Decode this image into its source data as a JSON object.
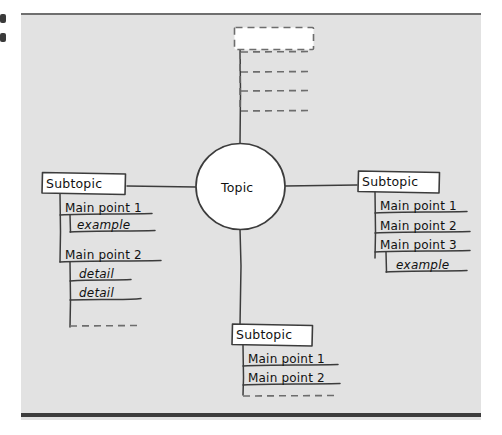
{
  "diagram": {
    "type": "mind-map",
    "title_note": "hand-drawn mind map / outline template",
    "center": {
      "label": "Topic",
      "shape": "circle"
    },
    "branches": [
      {
        "id": "left",
        "direction": "left",
        "heading": "Subtopic",
        "items": [
          {
            "text": "Main point 1",
            "level": 1,
            "style": "solid"
          },
          {
            "text": "example",
            "level": 2,
            "style": "solid"
          },
          {
            "text": "Main point 2",
            "level": 1,
            "style": "solid"
          },
          {
            "text": "detail",
            "level": 2,
            "style": "solid"
          },
          {
            "text": "detail",
            "level": 2,
            "style": "solid"
          },
          {
            "text": "",
            "level": 2,
            "style": "dashed"
          }
        ]
      },
      {
        "id": "right",
        "direction": "right",
        "heading": "Subtopic",
        "items": [
          {
            "text": "Main point 1",
            "level": 1,
            "style": "solid"
          },
          {
            "text": "Main point 2",
            "level": 1,
            "style": "solid"
          },
          {
            "text": "Main point 3",
            "level": 1,
            "style": "solid"
          },
          {
            "text": "example",
            "level": 2,
            "style": "solid"
          }
        ]
      },
      {
        "id": "bottom",
        "direction": "down",
        "heading": "Subtopic",
        "items": [
          {
            "text": "Main point 1",
            "level": 1,
            "style": "solid"
          },
          {
            "text": "Main point 2",
            "level": 1,
            "style": "solid"
          },
          {
            "text": "",
            "level": 1,
            "style": "dashed"
          }
        ]
      },
      {
        "id": "top",
        "direction": "up",
        "heading": "",
        "heading_style": "dashed",
        "items": [
          {
            "text": "",
            "level": 1,
            "style": "dashed"
          },
          {
            "text": "",
            "level": 1,
            "style": "dashed"
          },
          {
            "text": "",
            "level": 1,
            "style": "dashed"
          }
        ]
      }
    ]
  },
  "colors": {
    "paper": "#e2e2e2",
    "ink": "#3c3c3c",
    "text": "#111111",
    "box_fill": "#ffffff",
    "top_rule": "#6f6f6f",
    "bottom_rule": "#3c3c3c"
  }
}
